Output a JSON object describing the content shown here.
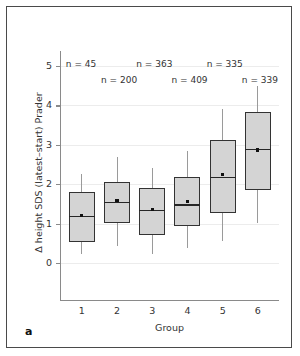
{
  "panel": {
    "label": "a"
  },
  "chart_data": {
    "type": "box",
    "title": "",
    "xlabel": "Group",
    "ylabel": "Δ height SDS (latest–start) Prader",
    "ylim": [
      -0.8,
      5.6
    ],
    "yticks": [
      0,
      1,
      2,
      3,
      4,
      5
    ],
    "ytick_labels": [
      "0",
      "1",
      "2",
      "3",
      "4",
      "5"
    ],
    "xticks": [
      1,
      2,
      3,
      4,
      5,
      6
    ],
    "xtick_labels": [
      "1",
      "2",
      "3",
      "4",
      "5",
      "6"
    ],
    "grid": true,
    "legend": "none",
    "box_fill_color": "#d4d4d4",
    "box_edge_color": "#333333",
    "whisker_color": "#9a9a9a",
    "categories": [
      "1",
      "2",
      "3",
      "4",
      "5",
      "6"
    ],
    "n_labels": [
      "n = 45",
      "n = 200",
      "n = 363",
      "n = 409",
      "n = 335",
      "n = 339"
    ],
    "n_values": [
      45,
      200,
      363,
      409,
      335,
      339
    ],
    "boxes": [
      {
        "group": "1",
        "n": 45,
        "whisker_low": 0.23,
        "q1": 0.53,
        "median": 1.2,
        "mean": 1.2,
        "q3": 1.79,
        "whisker_high": 2.26
      },
      {
        "group": "2",
        "n": 200,
        "whisker_low": 0.43,
        "q1": 1.01,
        "median": 1.56,
        "mean": 1.58,
        "q3": 2.05,
        "whisker_high": 2.68
      },
      {
        "group": "3",
        "n": 363,
        "whisker_low": 0.22,
        "q1": 0.72,
        "median": 1.35,
        "mean": 1.35,
        "q3": 1.9,
        "whisker_high": 2.4
      },
      {
        "group": "4",
        "n": 409,
        "whisker_low": 0.38,
        "q1": 0.94,
        "median": 1.49,
        "mean": 1.57,
        "q3": 2.18,
        "whisker_high": 2.84
      },
      {
        "group": "5",
        "n": 335,
        "whisker_low": 0.57,
        "q1": 1.28,
        "median": 2.19,
        "mean": 2.24,
        "q3": 3.12,
        "whisker_high": 3.91
      },
      {
        "group": "6",
        "n": 339,
        "whisker_low": 1.01,
        "q1": 1.84,
        "median": 2.9,
        "mean": 2.87,
        "q3": 3.82,
        "whisker_high": 4.49
      }
    ]
  }
}
